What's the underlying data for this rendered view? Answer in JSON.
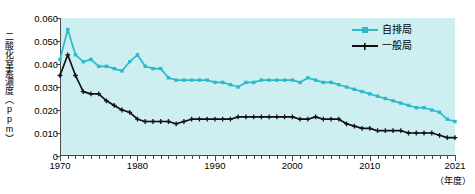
{
  "chart_data": {
    "type": "line",
    "title": "",
    "xlabel": "（年度）",
    "ylabel": "二酸化窒素濃度（ppm）",
    "xlim": [
      1970,
      2021
    ],
    "ylim": [
      0,
      0.06
    ],
    "grid": false,
    "legend_position": "top-right",
    "y_ticks": [
      "0",
      "0.010",
      "0.020",
      "0.030",
      "0.040",
      "0.050",
      "0.060"
    ],
    "y_tick_values": [
      0,
      0.01,
      0.02,
      0.03,
      0.04,
      0.05,
      0.06
    ],
    "x_ticks": [
      "1970",
      "1980",
      "1990",
      "2000",
      "2010",
      "2021"
    ],
    "x_tick_values": [
      1970,
      1980,
      1990,
      2000,
      2010,
      2021
    ],
    "x": [
      1970,
      1971,
      1972,
      1973,
      1974,
      1975,
      1976,
      1977,
      1978,
      1979,
      1980,
      1981,
      1982,
      1983,
      1984,
      1985,
      1986,
      1987,
      1988,
      1989,
      1990,
      1991,
      1992,
      1993,
      1994,
      1995,
      1996,
      1997,
      1998,
      1999,
      2000,
      2001,
      2002,
      2003,
      2004,
      2005,
      2006,
      2007,
      2008,
      2009,
      2010,
      2011,
      2012,
      2013,
      2014,
      2015,
      2016,
      2017,
      2018,
      2019,
      2020,
      2021
    ],
    "series": [
      {
        "name": "自排局",
        "color": "#2bbac8",
        "marker": "square",
        "values": [
          0.042,
          0.055,
          0.044,
          0.041,
          0.042,
          0.039,
          0.039,
          0.038,
          0.037,
          0.041,
          0.044,
          0.039,
          0.038,
          0.038,
          0.034,
          0.033,
          0.033,
          0.033,
          0.033,
          0.033,
          0.032,
          0.032,
          0.031,
          0.03,
          0.032,
          0.032,
          0.033,
          0.033,
          0.033,
          0.033,
          0.033,
          0.032,
          0.034,
          0.033,
          0.032,
          0.032,
          0.031,
          0.03,
          0.029,
          0.028,
          0.027,
          0.026,
          0.025,
          0.024,
          0.023,
          0.022,
          0.021,
          0.021,
          0.02,
          0.019,
          0.016,
          0.015
        ]
      },
      {
        "name": "一般局",
        "color": "#111111",
        "marker": "cross",
        "values": [
          0.035,
          0.044,
          0.035,
          0.028,
          0.027,
          0.027,
          0.024,
          0.022,
          0.02,
          0.019,
          0.016,
          0.015,
          0.015,
          0.015,
          0.015,
          0.014,
          0.015,
          0.016,
          0.016,
          0.016,
          0.016,
          0.016,
          0.016,
          0.017,
          0.017,
          0.017,
          0.017,
          0.017,
          0.017,
          0.017,
          0.017,
          0.016,
          0.016,
          0.017,
          0.016,
          0.016,
          0.016,
          0.014,
          0.013,
          0.012,
          0.012,
          0.011,
          0.011,
          0.011,
          0.011,
          0.01,
          0.01,
          0.01,
          0.01,
          0.009,
          0.008,
          0.008
        ]
      }
    ]
  },
  "legend": {
    "items": [
      {
        "label": "自排局",
        "color": "#2bbac8"
      },
      {
        "label": "一般局",
        "color": "#111111"
      }
    ]
  },
  "axes": {
    "y_title": "二酸化窒素濃度（ppm）",
    "x_unit": "（年度）"
  },
  "colors": {
    "plot_background": "#cdeff2",
    "axis": "#4a4a4a",
    "series_1": "#2bbac8",
    "series_2": "#111111",
    "page_background": "#ffffff"
  }
}
